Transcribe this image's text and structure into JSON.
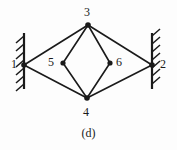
{
  "figure": {
    "caption": "(d)",
    "type": "truss-linkage-diagram",
    "background_color": "#fdfdfd",
    "line_color": "#1a1a1a",
    "nodes": [
      {
        "id": "1",
        "label": "1",
        "x": 24,
        "y": 65,
        "label_x": 11,
        "label_y": 58,
        "kind": "support-pin-left"
      },
      {
        "id": "2",
        "label": "2",
        "x": 152,
        "y": 65,
        "label_x": 160,
        "label_y": 58,
        "kind": "support-pin-right"
      },
      {
        "id": "3",
        "label": "3",
        "x": 88,
        "y": 25,
        "label_x": 84,
        "label_y": 6,
        "kind": "free-joint"
      },
      {
        "id": "4",
        "label": "4",
        "x": 87,
        "y": 98,
        "label_x": 83,
        "label_y": 106,
        "kind": "free-joint"
      },
      {
        "id": "5",
        "label": "5",
        "x": 63,
        "y": 63,
        "label_x": 48,
        "label_y": 56,
        "kind": "free-joint"
      },
      {
        "id": "6",
        "label": "6",
        "x": 110,
        "y": 63,
        "label_x": 116,
        "label_y": 56,
        "kind": "free-joint"
      }
    ],
    "members": [
      {
        "from": "1",
        "to": "3"
      },
      {
        "from": "1",
        "to": "4"
      },
      {
        "from": "2",
        "to": "3"
      },
      {
        "from": "2",
        "to": "4"
      },
      {
        "from": "3",
        "to": "5"
      },
      {
        "from": "3",
        "to": "6"
      },
      {
        "from": "4",
        "to": "5"
      },
      {
        "from": "4",
        "to": "6"
      }
    ],
    "supports": [
      {
        "side": "left",
        "x": 24,
        "y_top": 33,
        "y_bottom": 89,
        "hatch_side": "left"
      },
      {
        "side": "right",
        "x": 152,
        "y_top": 33,
        "y_bottom": 89,
        "hatch_side": "right"
      }
    ]
  }
}
